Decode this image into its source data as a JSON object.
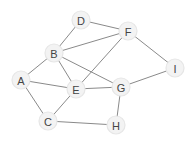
{
  "diagram": {
    "type": "undirected-graph",
    "colors": {
      "edge": "#8a8a8a",
      "node_fill": "#f3f3f3",
      "node_stroke": "#e6e6e6",
      "label": "#444444",
      "background": "#ffffff"
    },
    "nodes": [
      {
        "id": "D",
        "label": "D",
        "x": 81,
        "y": 20
      },
      {
        "id": "F",
        "label": "F",
        "x": 128,
        "y": 31
      },
      {
        "id": "B",
        "label": "B",
        "x": 54,
        "y": 53
      },
      {
        "id": "I",
        "label": "I",
        "x": 175,
        "y": 68
      },
      {
        "id": "A",
        "label": "A",
        "x": 21,
        "y": 80
      },
      {
        "id": "E",
        "label": "E",
        "x": 76,
        "y": 89
      },
      {
        "id": "G",
        "label": "G",
        "x": 121,
        "y": 87
      },
      {
        "id": "C",
        "label": "C",
        "x": 48,
        "y": 121
      },
      {
        "id": "H",
        "label": "H",
        "x": 116,
        "y": 125
      }
    ],
    "edges": [
      [
        "D",
        "B"
      ],
      [
        "D",
        "F"
      ],
      [
        "B",
        "F"
      ],
      [
        "B",
        "A"
      ],
      [
        "B",
        "E"
      ],
      [
        "B",
        "G"
      ],
      [
        "F",
        "E"
      ],
      [
        "F",
        "I"
      ],
      [
        "A",
        "E"
      ],
      [
        "A",
        "C"
      ],
      [
        "E",
        "G"
      ],
      [
        "E",
        "C"
      ],
      [
        "G",
        "I"
      ],
      [
        "G",
        "H"
      ],
      [
        "C",
        "H"
      ]
    ]
  }
}
